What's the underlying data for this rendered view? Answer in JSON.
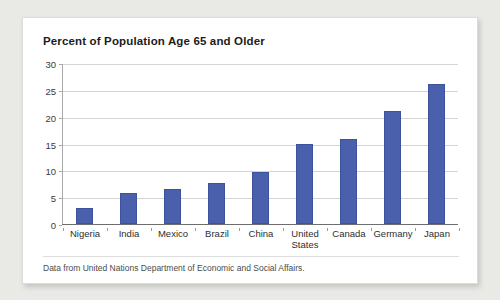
{
  "card": {
    "background_color": "#ffffff",
    "page_background_color": "#e9e9e6"
  },
  "chart_data": {
    "type": "bar",
    "title": "Percent of Population Age 65 and Older",
    "xlabel": "",
    "ylabel": "",
    "ylim": [
      0,
      30
    ],
    "yticks": [
      0,
      5,
      10,
      15,
      20,
      25,
      30
    ],
    "ytick_labels": [
      "0",
      "5",
      "10",
      "15",
      "20",
      "25",
      "30"
    ],
    "grid": true,
    "legend": false,
    "bar_color": "#4a60ac",
    "categories": [
      "Nigeria",
      "India",
      "Mexico",
      "Brazil",
      "China",
      "United States",
      "Canada",
      "Germany",
      "Japan"
    ],
    "values": [
      3.0,
      5.7,
      6.6,
      7.7,
      9.7,
      14.9,
      15.9,
      21.0,
      26.0
    ],
    "caption": "Data from United Nations Department of Economic and Social Affairs."
  }
}
